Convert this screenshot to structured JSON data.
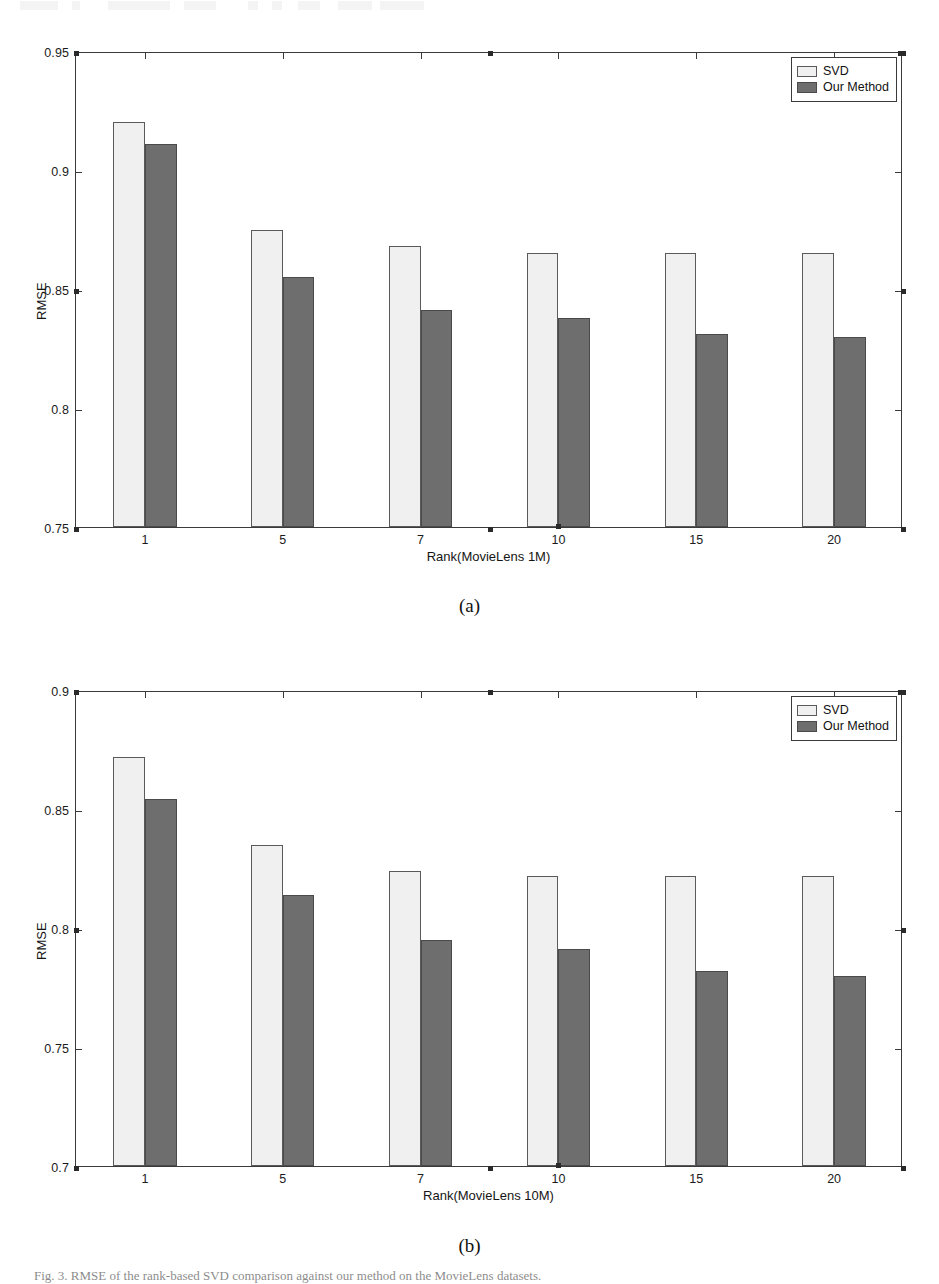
{
  "figure": {
    "subcaption_a": "(a)",
    "subcaption_b": "(b)",
    "bottom_caption": "Fig. 3.   RMSE of the rank-based SVD comparison against our method on the MovieLens datasets."
  },
  "legend": {
    "svd_label": "SVD",
    "ours_label": "Our Method"
  },
  "chart_data": [
    {
      "id": "chart-a",
      "type": "bar",
      "title": "",
      "xlabel": "Rank(MovieLens 1M)",
      "ylabel": "RMSE",
      "categories": [
        "1",
        "5",
        "7",
        "10",
        "15",
        "20"
      ],
      "yticks": [
        "0.95",
        "0.9",
        "0.85",
        "0.8",
        "0.75"
      ],
      "ylim": [
        0.75,
        0.95
      ],
      "grid": false,
      "legend_position": "top-right",
      "series": [
        {
          "name": "SVD",
          "color": "#f0f0f0",
          "values": [
            0.92,
            0.875,
            0.868,
            0.865,
            0.865,
            0.865
          ]
        },
        {
          "name": "Our Method",
          "color": "#6e6e6e",
          "values": [
            0.911,
            0.855,
            0.841,
            0.838,
            0.831,
            0.83
          ]
        }
      ]
    },
    {
      "id": "chart-b",
      "type": "bar",
      "title": "",
      "xlabel": "Rank(MovieLens 10M)",
      "ylabel": "RMSE",
      "categories": [
        "1",
        "5",
        "7",
        "10",
        "15",
        "20"
      ],
      "yticks": [
        "0.9",
        "0.85",
        "0.8",
        "0.75",
        "0.7"
      ],
      "ylim": [
        0.7,
        0.9
      ],
      "grid": false,
      "legend_position": "top-right",
      "series": [
        {
          "name": "SVD",
          "color": "#f0f0f0",
          "values": [
            0.872,
            0.835,
            0.824,
            0.822,
            0.822,
            0.822
          ]
        },
        {
          "name": "Our Method",
          "color": "#6e6e6e",
          "values": [
            0.854,
            0.814,
            0.795,
            0.791,
            0.782,
            0.78
          ]
        }
      ]
    }
  ]
}
